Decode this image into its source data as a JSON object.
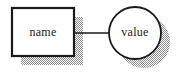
{
  "diagram": {
    "background_color": "#ffffff",
    "stroke_color": "#1a1a1a",
    "fill_color": "#ffffff",
    "shadow_color": "#9a9a9a",
    "nodes": [
      {
        "id": "name-node",
        "label": "name",
        "shape": "rectangle",
        "x": 12,
        "y": 8,
        "width": 62,
        "height": 48,
        "shadow_offset_x": 9,
        "shadow_offset_y": 9
      },
      {
        "id": "value-node",
        "label": "value",
        "shape": "circle",
        "cx": 135,
        "cy": 33,
        "r": 26,
        "shadow_offset_x": 9,
        "shadow_offset_y": 9
      }
    ],
    "edges": [
      {
        "id": "name-to-value-connector",
        "from": "name-node",
        "to": "value-node",
        "x1": 74,
        "y1": 33,
        "x2": 109,
        "y2": 33
      }
    ]
  }
}
